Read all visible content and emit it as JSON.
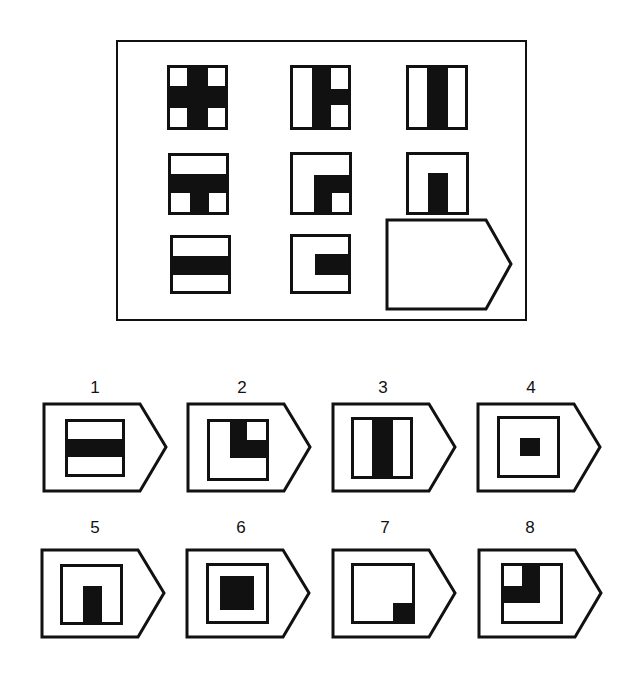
{
  "puzzle": {
    "matrix": {
      "rows": 3,
      "cols": 3,
      "cells": [
        {
          "id": "r1c1",
          "pattern": "four-corner-white-squares-with-black-cross"
        },
        {
          "id": "r1c2",
          "pattern": "black-center-column-with-right-arm, white left strip, white right corners"
        },
        {
          "id": "r1c3",
          "pattern": "black-center-vertical-bar"
        },
        {
          "id": "r2c1",
          "pattern": "black-horizontal-bar-with-center-leg, white bottom corners"
        },
        {
          "id": "r2c2",
          "pattern": "black-L corner (middle-right) with white bottom-right square"
        },
        {
          "id": "r2c3",
          "pattern": "black-center-pillar-rising-from-bottom"
        },
        {
          "id": "r3c1",
          "pattern": "black-horizontal-bar"
        },
        {
          "id": "r3c2",
          "pattern": "black-horizontal-arm-from-right"
        },
        {
          "id": "r3c3",
          "pattern": "missing (blank pentagon answer slot)"
        }
      ]
    },
    "options": [
      {
        "label": "1",
        "pattern": "black-horizontal-bar"
      },
      {
        "label": "2",
        "pattern": "black-L top-right with white top-right square"
      },
      {
        "label": "3",
        "pattern": "black-center-vertical-bar"
      },
      {
        "label": "4",
        "pattern": "small-black-center-square"
      },
      {
        "label": "5",
        "pattern": "black-center-pillar-rising-from-bottom"
      },
      {
        "label": "6",
        "pattern": "large-black-center-square"
      },
      {
        "label": "7",
        "pattern": "black-bottom-right-corner-square"
      },
      {
        "label": "8",
        "pattern": "black-L top-left with white top-left square"
      }
    ]
  },
  "colors": {
    "ink": "#111111",
    "paper": "#ffffff"
  }
}
